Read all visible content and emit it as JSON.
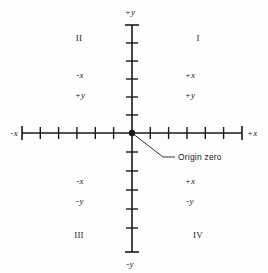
{
  "diagram": {
    "background_color": "#fefefe",
    "axis_color": "#1a1a1a",
    "axis": {
      "y_top_label": "+y",
      "y_bottom_label": "-y",
      "x_left_label": "-x",
      "x_right_label": "+x",
      "origin_label": "Origin zero",
      "x_ticks_per_side": 6,
      "y_ticks_per_side": 6,
      "origin_x": 132,
      "origin_y": 133
    },
    "quadrants": [
      {
        "numeral": "I",
        "numeral_x": 198,
        "numeral_y": 38,
        "sign_x": "+x",
        "sign_y": "+y",
        "sign_x_pos": [
          190,
          75
        ],
        "sign_y_pos": [
          190,
          95
        ]
      },
      {
        "numeral": "II",
        "numeral_x": 79,
        "numeral_y": 38,
        "sign_x": "-x",
        "sign_y": "+y",
        "sign_x_pos": [
          80,
          75
        ],
        "sign_y_pos": [
          80,
          95
        ]
      },
      {
        "numeral": "III",
        "numeral_x": 79,
        "numeral_y": 235,
        "sign_x": "-x",
        "sign_y": "-y",
        "sign_x_pos": [
          80,
          181
        ],
        "sign_y_pos": [
          80,
          201
        ]
      },
      {
        "numeral": "IV",
        "numeral_x": 198,
        "numeral_y": 235,
        "sign_x": "+x",
        "sign_y": "-y",
        "sign_x_pos": [
          190,
          181
        ],
        "sign_y_pos": [
          190,
          201
        ]
      }
    ]
  }
}
